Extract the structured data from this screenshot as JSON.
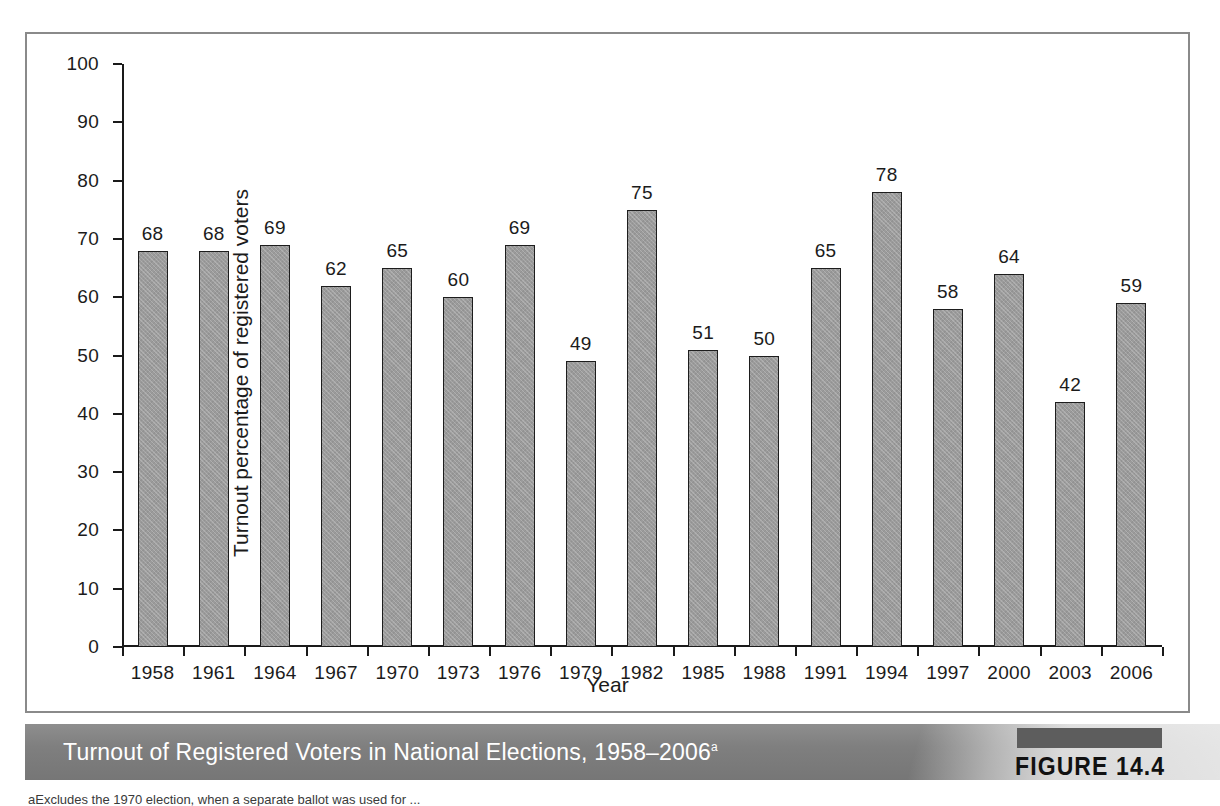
{
  "figure": {
    "caption": "Turnout of Registered Voters in National Elections, 1958–2006",
    "caption_superscript": "a",
    "figure_number": "FIGURE 14.4",
    "footnote": "aExcludes the 1970 election, when a separate ballot was used for ..."
  },
  "chart_data": {
    "type": "bar",
    "title": "Turnout of Registered Voters in National Elections, 1958–2006",
    "xlabel": "Year",
    "ylabel": "Turnout percentage of registered voters",
    "categories": [
      "1958",
      "1961",
      "1964",
      "1967",
      "1970",
      "1973",
      "1976",
      "1979",
      "1982",
      "1985",
      "1988",
      "1991",
      "1994",
      "1997",
      "2000",
      "2003",
      "2006"
    ],
    "values": [
      68,
      68,
      69,
      62,
      65,
      60,
      69,
      49,
      75,
      51,
      50,
      65,
      78,
      58,
      64,
      42,
      59
    ],
    "ylim": [
      0,
      100
    ],
    "yticks": [
      0,
      10,
      20,
      30,
      40,
      50,
      60,
      70,
      80,
      90,
      100
    ],
    "ytick_labels": [
      "0",
      "10",
      "20",
      "30",
      "40",
      "50",
      "60",
      "70",
      "80",
      "90",
      "100"
    ],
    "grid": false,
    "legend": null,
    "data_labels": true,
    "bar_color": "#9b9b9b",
    "bar_edge_color": "#1d1d1d"
  },
  "colors": {
    "frame_border": "#8a8a8a",
    "banner_background": "#7f7f7f",
    "banner_text": "#ffffff",
    "figure_tab": "#5d5d5d",
    "axis": "#1a1a1a",
    "text": "#1b1b1b"
  }
}
